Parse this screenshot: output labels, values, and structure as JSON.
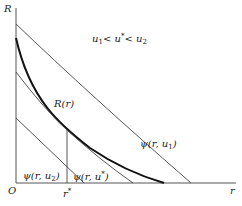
{
  "diagram": {
    "axes": {
      "y_label": "R",
      "x_label": "r",
      "origin_label": "O",
      "r_star_label": "r",
      "r_star_sup": "*"
    },
    "condition": {
      "u1": "u",
      "u1_sub": "1",
      "lt1": "<",
      "ustar": "u",
      "ustar_sup": "*",
      "lt2": "<",
      "u2": "u",
      "u2_sub": "2"
    },
    "curves": {
      "R": {
        "label": "R(r)"
      },
      "psi_u1": {
        "prefix": "ψ(r, u",
        "sub": "1",
        "suffix": ")"
      },
      "psi_ustar": {
        "prefix": "ψ(r, u",
        "sup": "*",
        "suffix": ")"
      },
      "psi_u2": {
        "prefix": "ψ(r, u",
        "sub": "2",
        "suffix": ")"
      }
    }
  }
}
